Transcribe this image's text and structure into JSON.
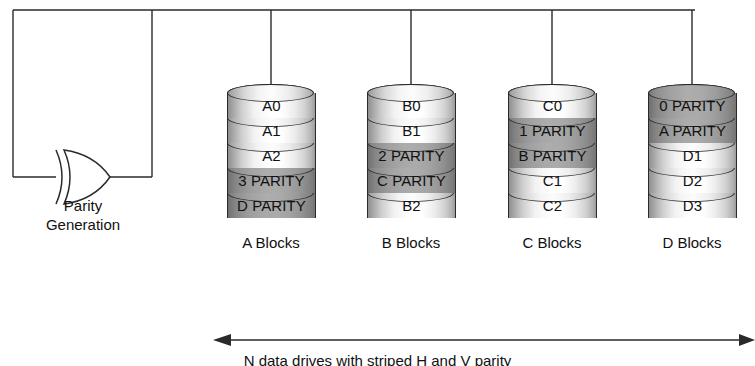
{
  "diagram": {
    "bus_label": "",
    "parity_unit": {
      "label_line1": "Parity",
      "label_line2": "Generation",
      "gate_icon": "xor-gate-icon"
    },
    "bottom_caption": "N data drives with striped H and V parity",
    "arrow_icon": "double-headed-arrow-icon",
    "colors": {
      "line": "#2a2a2a",
      "text": "#111111",
      "data_band": "#ffffff",
      "parity_band": "#9e9e9e",
      "background": "#ffffff"
    },
    "drives": [
      {
        "name": "A Blocks",
        "caption": "A Blocks",
        "blocks": [
          {
            "label": "A0",
            "kind": "data"
          },
          {
            "label": "A1",
            "kind": "data"
          },
          {
            "label": "A2",
            "kind": "data"
          },
          {
            "label": "3 PARITY",
            "kind": "parity"
          },
          {
            "label": "D PARITY",
            "kind": "parity"
          }
        ]
      },
      {
        "name": "B Blocks",
        "caption": "B Blocks",
        "blocks": [
          {
            "label": "B0",
            "kind": "data"
          },
          {
            "label": "B1",
            "kind": "data"
          },
          {
            "label": "2 PARITY",
            "kind": "parity"
          },
          {
            "label": "C PARITY",
            "kind": "parity"
          },
          {
            "label": "B2",
            "kind": "data"
          }
        ]
      },
      {
        "name": "C Blocks",
        "caption": "C Blocks",
        "blocks": [
          {
            "label": "C0",
            "kind": "data"
          },
          {
            "label": "1 PARITY",
            "kind": "parity"
          },
          {
            "label": "B PARITY",
            "kind": "parity"
          },
          {
            "label": "C1",
            "kind": "data"
          },
          {
            "label": "C2",
            "kind": "data"
          }
        ]
      },
      {
        "name": "D Blocks",
        "caption": "D Blocks",
        "blocks": [
          {
            "label": "0 PARITY",
            "kind": "parity"
          },
          {
            "label": "A PARITY",
            "kind": "parity"
          },
          {
            "label": "D1",
            "kind": "data"
          },
          {
            "label": "D2",
            "kind": "data"
          },
          {
            "label": "D3",
            "kind": "data"
          }
        ]
      }
    ]
  }
}
